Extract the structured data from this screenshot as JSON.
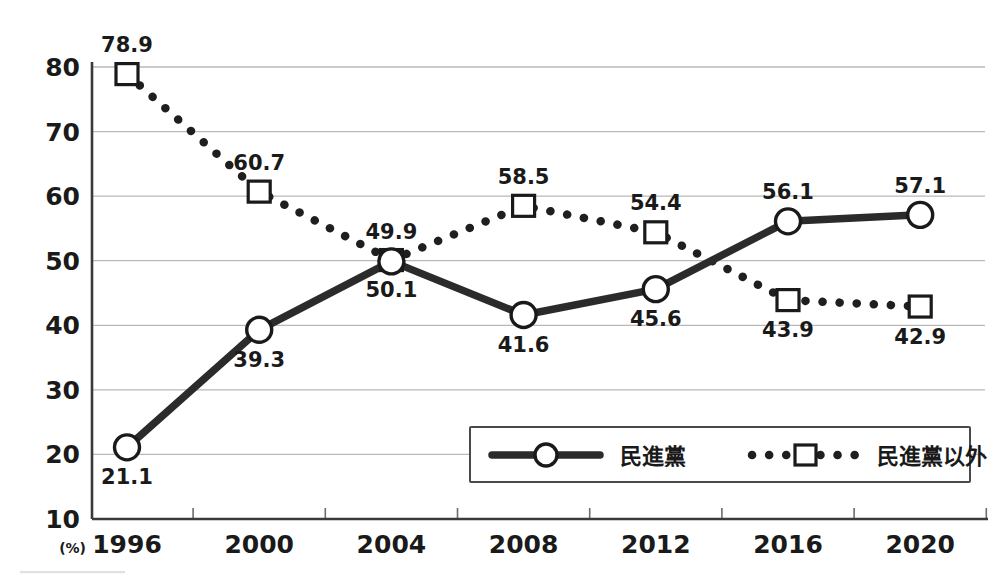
{
  "chart_data": {
    "type": "line",
    "title": "",
    "subtitle": "",
    "xlabel": "",
    "ylabel": "",
    "unit_label": "(%)",
    "categories": [
      "1996",
      "2000",
      "2004",
      "2008",
      "2012",
      "2016",
      "2020"
    ],
    "x": [
      1996,
      2000,
      2004,
      2008,
      2012,
      2016,
      2020
    ],
    "xlim": [
      1994,
      2022
    ],
    "ylim": [
      10,
      80
    ],
    "yticks": [
      10,
      20,
      30,
      40,
      50,
      60,
      70,
      80
    ],
    "ytick_labels": [
      "10",
      "20",
      "30",
      "40",
      "50",
      "60",
      "70",
      "80"
    ],
    "grid": true,
    "grid_axis": "y",
    "legend_position": "bottom-right",
    "series": [
      {
        "name": "民進黨",
        "marker": "circle",
        "line_style": "solid",
        "color": "#2b2b2b",
        "values": [
          21.1,
          39.3,
          49.9,
          41.6,
          45.6,
          56.1,
          57.1
        ],
        "value_labels": [
          "21.1",
          "39.3",
          "49.9",
          "41.6",
          "45.6",
          "56.1",
          "57.1"
        ],
        "label_positions": [
          "below",
          "below",
          "above",
          "below",
          "below",
          "above",
          "above"
        ]
      },
      {
        "name": "民進黨以外",
        "marker": "square",
        "line_style": "dotted",
        "color": "#1f1f1f",
        "values": [
          78.9,
          60.7,
          50.1,
          58.5,
          54.4,
          43.9,
          42.9
        ],
        "value_labels": [
          "78.9",
          "60.7",
          "50.1",
          "58.5",
          "54.4",
          "43.9",
          "42.9"
        ],
        "label_positions": [
          "above",
          "above",
          "below",
          "above",
          "above",
          "below",
          "below"
        ]
      }
    ]
  },
  "legend": {
    "entries": [
      {
        "label": "民進黨",
        "marker": "circle",
        "line_style": "solid"
      },
      {
        "label": "民進黨以外",
        "marker": "square",
        "line_style": "dotted"
      }
    ]
  },
  "axes": {
    "y_tick_labels": [
      "80",
      "70",
      "60",
      "50",
      "40",
      "30",
      "20",
      "10"
    ],
    "x_tick_labels": [
      "1996",
      "2000",
      "2004",
      "2008",
      "2012",
      "2016",
      "2020"
    ],
    "unit_label": "(%)"
  },
  "colors": {
    "background": "#ffffff",
    "gridline": "#b9b9b9",
    "axis": "#3a3a3a",
    "ink": "#1a1a1a"
  }
}
